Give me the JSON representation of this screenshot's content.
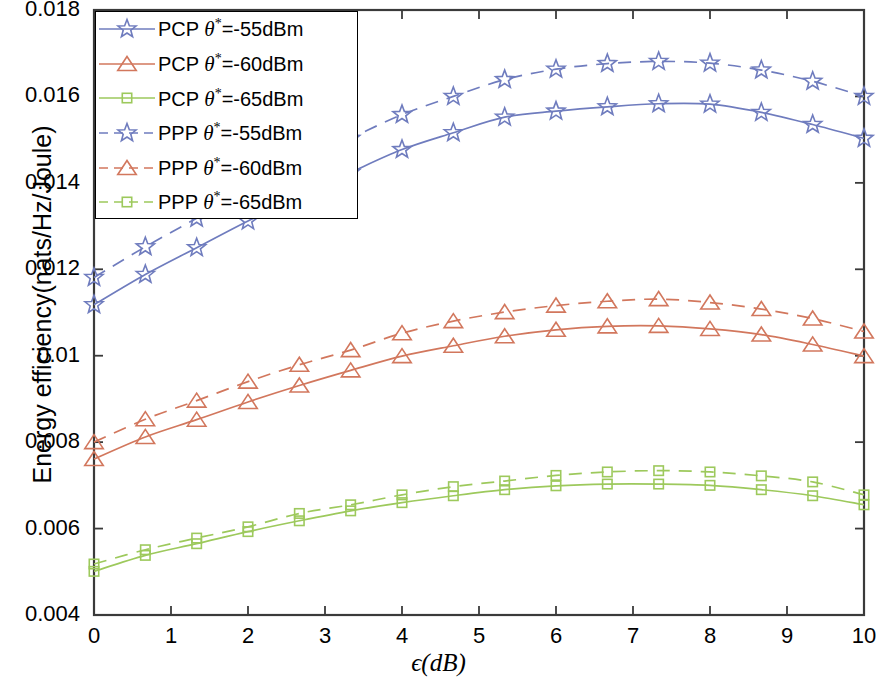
{
  "chart_data": {
    "type": "line",
    "title": "",
    "xlabel": "ϵ(dB)",
    "ylabel": "Energy efficiency(nats/Hz/Joule)",
    "xlim": [
      0,
      10
    ],
    "ylim": [
      0.004,
      0.018
    ],
    "xticks": [
      "0",
      "1",
      "2",
      "3",
      "4",
      "5",
      "6",
      "7",
      "8",
      "9",
      "10"
    ],
    "yticks": [
      "0.004",
      "0.006",
      "0.008",
      "0.01",
      "0.012",
      "0.014",
      "0.016",
      "0.018"
    ],
    "grid": false,
    "legend_position": "upper-left",
    "x": [
      0,
      0.6667,
      1.3333,
      2,
      2.6667,
      3.3333,
      4,
      4.6667,
      5.3333,
      6,
      6.6667,
      7.3333,
      8,
      8.6667,
      9.3333,
      10
    ],
    "series": [
      {
        "name": "PCP θ*=-55dBm",
        "color": "#6f7cbe",
        "marker": "star",
        "linestyle": "solid",
        "values": [
          0.01118,
          0.01188,
          0.0125,
          0.01312,
          0.01368,
          0.01424,
          0.01477,
          0.01516,
          0.01552,
          0.01566,
          0.01576,
          0.01583,
          0.01582,
          0.01563,
          0.01535,
          0.01503
        ]
      },
      {
        "name": "PCP θ*=-60dBm",
        "color": "#d2775d",
        "marker": "triangle",
        "linestyle": "solid",
        "values": [
          0.00761,
          0.00812,
          0.00852,
          0.00893,
          0.00931,
          0.00966,
          0.00999,
          0.01023,
          0.01045,
          0.0106,
          0.01068,
          0.01069,
          0.01062,
          0.01049,
          0.01026,
          0.00999
        ]
      },
      {
        "name": "PCP θ*=-65dBm",
        "color": "#9dc95c",
        "marker": "square",
        "linestyle": "solid",
        "values": [
          0.00501,
          0.00538,
          0.00565,
          0.00593,
          0.00618,
          0.00641,
          0.0066,
          0.00676,
          0.0069,
          0.00699,
          0.00703,
          0.00703,
          0.007,
          0.0069,
          0.00676,
          0.00655
        ]
      },
      {
        "name": "PPP θ*=-55dBm",
        "color": "#6f7cbe",
        "marker": "star",
        "linestyle": "dashed",
        "values": [
          0.01181,
          0.01252,
          0.01318,
          0.01382,
          0.01447,
          0.01503,
          0.01558,
          0.016,
          0.01639,
          0.01663,
          0.01676,
          0.01681,
          0.01677,
          0.01661,
          0.01635,
          0.016
        ]
      },
      {
        "name": "PPP θ*=-60dBm",
        "color": "#d2775d",
        "marker": "triangle",
        "linestyle": "dashed",
        "values": [
          0.008,
          0.00853,
          0.00896,
          0.0094,
          0.00979,
          0.01013,
          0.01052,
          0.0108,
          0.01101,
          0.01116,
          0.01126,
          0.01131,
          0.01123,
          0.01108,
          0.01086,
          0.01056
        ]
      },
      {
        "name": "PPP θ*=-65dBm",
        "color": "#9dc95c",
        "marker": "square",
        "linestyle": "dashed",
        "values": [
          0.00518,
          0.00551,
          0.00578,
          0.00604,
          0.00635,
          0.00655,
          0.00678,
          0.00697,
          0.0071,
          0.00723,
          0.00731,
          0.00734,
          0.00731,
          0.00722,
          0.00708,
          0.00678
        ]
      }
    ]
  },
  "legend": {
    "items": [
      {
        "prefix": "PCP ",
        "theta": "θ",
        "star": "*",
        "suffix": "=-55dBm",
        "color": "#6f7cbe",
        "marker": "star",
        "linestyle": "solid"
      },
      {
        "prefix": "PCP ",
        "theta": "θ",
        "star": "*",
        "suffix": "=-60dBm",
        "color": "#d2775d",
        "marker": "triangle",
        "linestyle": "solid"
      },
      {
        "prefix": "PCP ",
        "theta": "θ",
        "star": "*",
        "suffix": "=-65dBm",
        "color": "#9dc95c",
        "marker": "square",
        "linestyle": "solid"
      },
      {
        "prefix": "PPP ",
        "theta": "θ",
        "star": "*",
        "suffix": "=-55dBm",
        "color": "#6f7cbe",
        "marker": "star",
        "linestyle": "dashed"
      },
      {
        "prefix": "PPP ",
        "theta": "θ",
        "star": "*",
        "suffix": "=-60dBm",
        "color": "#d2775d",
        "marker": "triangle",
        "linestyle": "dashed"
      },
      {
        "prefix": "PPP ",
        "theta": "θ",
        "star": "*",
        "suffix": "=-65dBm",
        "color": "#9dc95c",
        "marker": "square",
        "linestyle": "dashed"
      }
    ]
  },
  "axes": {
    "frame_color": "#3a3a3a"
  }
}
